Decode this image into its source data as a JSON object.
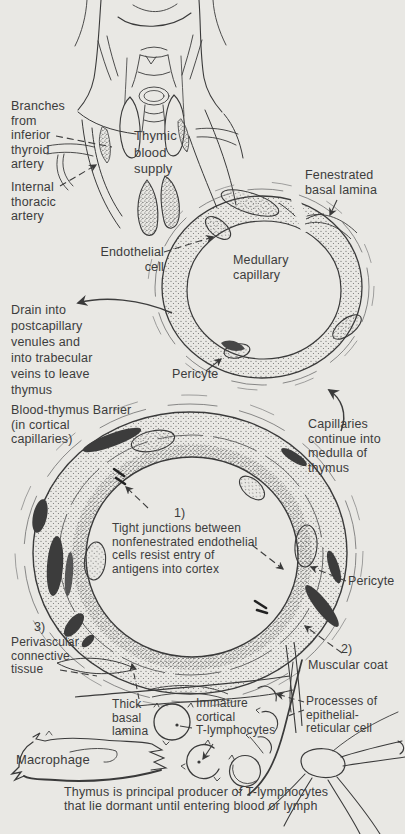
{
  "figure": {
    "background_color": "#e9e8e4",
    "ink_color": "#333333",
    "text_color": "#3c3c3c"
  },
  "labels": {
    "branches_inferior_thyroid": "Branches\nfrom\ninferior\nthyroid\nartery",
    "thymic_blood_supply": "Thymic\nblood\nsupply",
    "internal_thoracic": "Internal\nthoracic\nartery",
    "fenestrated_basal_lamina": "Fenestrated\nbasal lamina",
    "endothelial_cell": "Endothelial\ncell",
    "medullary_capillary": "Medullary\ncapillary",
    "drain_note": "Drain into\npostcapillary\nvenules and\ninto trabecular\nveins to leave\nthymus",
    "pericyte_medullary": "Pericyte",
    "capillaries_continue": "Capillaries\ncontinue into\nmedulla of\nthymus",
    "blood_thymus_barrier": "Blood-thymus Barrier\n(in cortical\ncapillaries)",
    "item1_number": "1)",
    "tight_junctions": "Tight junctions between\nnonfenestrated endothelial\ncells resist entry of\nantigens into cortex",
    "pericyte_cortical": "Pericyte",
    "item3_number": "3)",
    "perivascular_tissue": "Perivascular\nconnective\ntissue",
    "thick_basal_lamina": "Thick\nbasal\nlamina",
    "macrophage": "Macrophage",
    "immature_t_lymphocytes": "Immature\ncortical\nT-lymphocytes",
    "item2_number": "2)",
    "muscular_coat": "Muscular coat",
    "processes_reticular": "Processes of\nepithelial-\nreticular cell",
    "caption": "Thymus is principal producer of T-lymphocytes\nthat lie dormant until entering blood or lymph"
  }
}
